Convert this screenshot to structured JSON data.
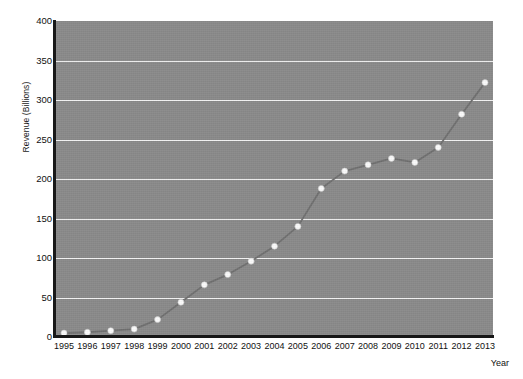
{
  "chart_data": {
    "type": "line",
    "title": "",
    "xlabel": "Year",
    "ylabel": "Revenue (Billions)",
    "categories": [
      "1995",
      "1996",
      "1997",
      "1998",
      "1999",
      "2000",
      "2001",
      "2002",
      "2003",
      "2004",
      "2005",
      "2006",
      "2007",
      "2008",
      "2009",
      "2010",
      "2011",
      "2012",
      "2013"
    ],
    "x": [
      1995,
      1996,
      1997,
      1998,
      1999,
      2000,
      2001,
      2002,
      2003,
      2004,
      2005,
      2006,
      2007,
      2008,
      2009,
      2010,
      2011,
      2012,
      2013
    ],
    "values": [
      5,
      6,
      8,
      10,
      22,
      44,
      66,
      79,
      96,
      115,
      140,
      188,
      210,
      218,
      226,
      221,
      240,
      282,
      322
    ],
    "series": [
      {
        "name": "Revenue",
        "values": [
          5,
          6,
          8,
          10,
          22,
          44,
          66,
          79,
          96,
          115,
          140,
          188,
          210,
          218,
          226,
          221,
          240,
          282,
          322
        ]
      }
    ],
    "ylim": [
      0,
      400
    ],
    "yticks": [
      0,
      50,
      100,
      150,
      200,
      250,
      300,
      350,
      400
    ],
    "ytick_labels": [
      "0",
      "50",
      "100",
      "150",
      "200",
      "250",
      "300",
      "350",
      "400"
    ],
    "xlim": [
      1995,
      2013
    ],
    "grid": "horizontal-only",
    "legend": "none",
    "marker": "circle",
    "colors": {
      "plot_background": "#8a8a8a",
      "figure_background": "#ffffff",
      "gridline": "#f2f2f2",
      "line": "#6f6f6f",
      "marker_fill": "#fbfbfb",
      "axis_spine": "#181818",
      "tick_text": "#111111"
    }
  },
  "axes": {
    "y_title": "Revenue (Billions)",
    "x_title": "Year"
  }
}
